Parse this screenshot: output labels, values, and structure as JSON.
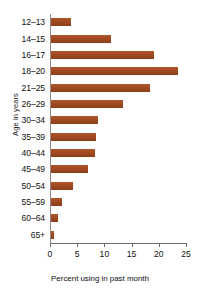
{
  "chart_data": {
    "type": "bar",
    "orientation": "horizontal",
    "title": "",
    "xlabel": "Percent using in past month",
    "ylabel": "Age in years",
    "categories": [
      "12–13",
      "14–15",
      "16–17",
      "18–20",
      "21–25",
      "26–29",
      "30–34",
      "35–39",
      "40–44",
      "45–49",
      "50–54",
      "55–59",
      "60–64",
      "65+"
    ],
    "values": [
      3.7,
      11.0,
      19.0,
      23.3,
      18.2,
      13.3,
      8.7,
      8.3,
      8.0,
      6.8,
      4.0,
      2.0,
      1.2,
      0.6
    ],
    "xlim": [
      0,
      25
    ],
    "xticks": [
      0,
      5,
      10,
      15,
      20,
      25
    ],
    "xticklabels": [
      "0",
      "5",
      "10",
      "15",
      "20",
      "25"
    ],
    "grid": false,
    "legend": false,
    "bar_color": "#a04a1f",
    "axis_color": "#6e6e6e"
  }
}
